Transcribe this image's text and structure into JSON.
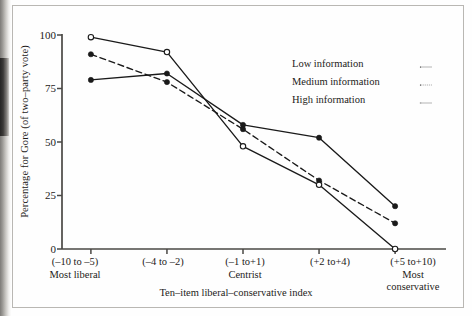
{
  "figure": {
    "y_axis_title": "Percentage for Gore (of two–party vote)",
    "x_axis_title": "Ten–item liberal–conservative index"
  },
  "legend": {
    "position": "upper-right-inside",
    "entries": [
      {
        "label": "Low information",
        "style": "solid-filled-circle"
      },
      {
        "label": "Medium information",
        "style": "dashed-filled-circle"
      },
      {
        "label": "High information",
        "style": "solid-open-circle"
      }
    ]
  },
  "chart_data": {
    "type": "line",
    "title": "",
    "subtitle": "",
    "xlabel": "Ten–item liberal–conservative index",
    "ylabel": "Percentage for Gore (of two–party vote)",
    "categories": [
      "(–10 to –5)",
      "(–4 to –2)",
      "(–1 to+1)",
      "(+2 to+4)",
      "(+5 to+10)"
    ],
    "category_sublabels": [
      "Most liberal",
      "",
      "Centrist",
      "",
      "Most conservative"
    ],
    "ylim": [
      0,
      100
    ],
    "yticks": [
      0,
      25,
      50,
      75,
      100
    ],
    "grid": false,
    "series": [
      {
        "name": "Low information",
        "marker": "filled-circle",
        "line": "solid",
        "values": [
          79,
          82,
          58,
          52,
          20
        ]
      },
      {
        "name": "Medium information",
        "marker": "filled-circle",
        "line": "dashed",
        "values": [
          91,
          78,
          56,
          32,
          12
        ]
      },
      {
        "name": "High information",
        "marker": "open-circle",
        "line": "solid",
        "values": [
          99,
          92,
          48,
          30,
          0
        ]
      }
    ],
    "colors": {
      "ink": "#1a1a1a",
      "axis": "#4a4845",
      "background": "#fefefe"
    }
  }
}
